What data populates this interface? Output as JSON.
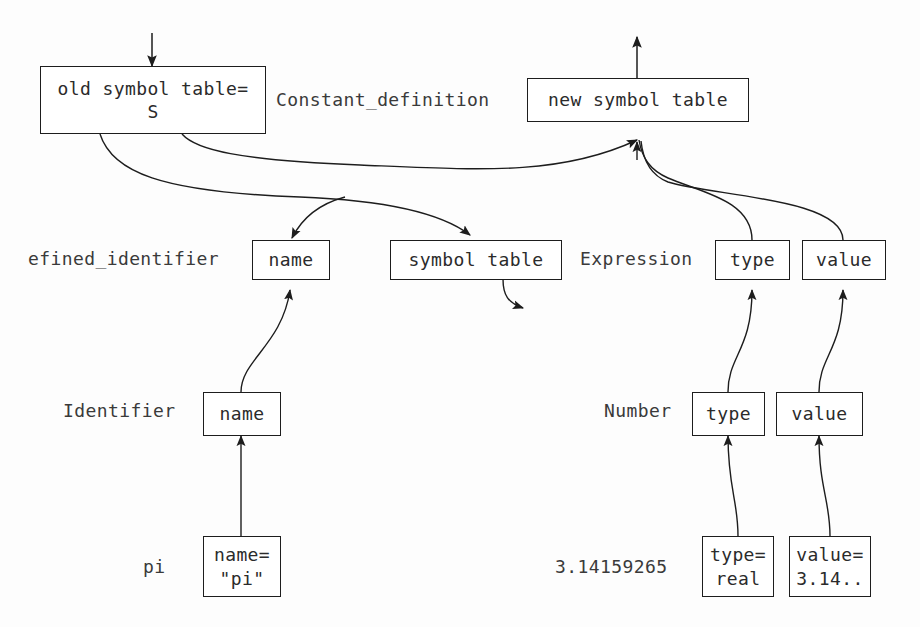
{
  "diagram": {
    "stroke_color": "#1d1d1d",
    "text_color": "#2b2b2b",
    "label_color": "#3a3a3a",
    "background": "#fdfdfd"
  },
  "nodes": {
    "old_symbol_table": "old symbol table=\nS",
    "new_symbol_table": "new symbol table",
    "defined_identifier_name": "name",
    "symbol_table": "symbol table",
    "expression_type": "type",
    "expression_value": "value",
    "identifier_name": "name",
    "number_type": "type",
    "number_value": "value",
    "pi_name": "name=\n\"pi\"",
    "number_type_leaf": "type=\nreal",
    "number_value_leaf": "value=\n3.14.."
  },
  "labels": {
    "constant_definition": "Constant_definition",
    "defined_identifier": "efined_identifier",
    "expression": "Expression",
    "identifier": "Identifier",
    "number": "Number",
    "pi": "pi",
    "pi_value": "3.14159265"
  }
}
